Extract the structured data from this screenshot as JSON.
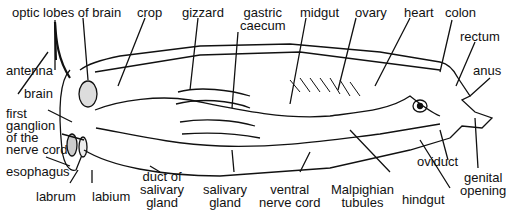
{
  "diagram": {
    "labels": {
      "optic_lobes": "optic lobes of brain",
      "crop": "crop",
      "gizzard": "gizzard",
      "gastric_caecum_1": "gastric",
      "gastric_caecum_2": "caecum",
      "midgut": "midgut",
      "ovary": "ovary",
      "heart": "heart",
      "colon": "colon",
      "rectum": "rectum",
      "anus": "anus",
      "antenna": "antenna",
      "brain": "brain",
      "first_ganglion_1": "first",
      "first_ganglion_2": "ganglion",
      "first_ganglion_3": "of the",
      "first_ganglion_4": "nerve cord",
      "esophagus": "esophagus",
      "labrum": "labrum",
      "labium": "labium",
      "duct_salivary_1": "duct of",
      "duct_salivary_2": "salivary",
      "duct_salivary_3": "gland",
      "salivary_gland_1": "salivary",
      "salivary_gland_2": "gland",
      "ventral_nerve_1": "ventral",
      "ventral_nerve_2": "nerve cord",
      "malpighian_1": "Malpighian",
      "malpighian_2": "tubules",
      "hindgut": "hindgut",
      "oviduct": "oviduct",
      "genital_1": "genital",
      "genital_2": "opening"
    }
  }
}
